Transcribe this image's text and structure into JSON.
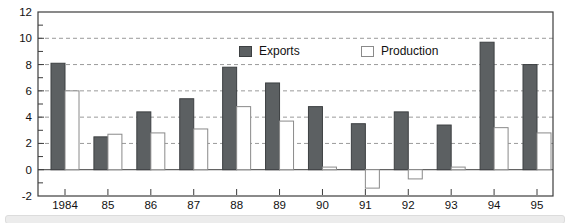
{
  "chart_data": {
    "type": "bar",
    "title": "",
    "xlabel": "",
    "ylabel": "",
    "categories": [
      "1984",
      "85",
      "86",
      "87",
      "88",
      "89",
      "90",
      "91",
      "92",
      "93",
      "94",
      "95"
    ],
    "series": [
      {
        "name": "Exports",
        "values": [
          8.1,
          2.5,
          4.4,
          5.4,
          7.8,
          6.6,
          4.8,
          3.5,
          4.4,
          3.4,
          9.7,
          8.0
        ],
        "fill": "#5c6062",
        "stroke": "#3d4042"
      },
      {
        "name": "Production",
        "values": [
          6.0,
          2.7,
          2.8,
          3.1,
          4.8,
          3.7,
          0.2,
          -1.4,
          -0.7,
          0.2,
          3.2,
          2.8
        ],
        "fill": "#ffffff",
        "stroke": "#8a8a8a"
      }
    ],
    "ylim": [
      -2,
      12
    ],
    "y_tick_labels": [
      "12",
      "10",
      "8",
      "6",
      "4",
      "2",
      "0",
      "-2"
    ],
    "y_labeled_values": [
      12,
      10,
      8,
      6,
      4,
      2,
      0,
      -2
    ],
    "gridline_values": [
      10,
      8,
      6,
      4,
      2
    ],
    "grid": "dashed-horizontal",
    "legend_position": "top-inside",
    "colors": {
      "frame": "#3c3c3c",
      "gridline": "#9a9a9a",
      "zero_line": "#3c3c3c",
      "tick": "#3c3c3c",
      "label_text": "#111111"
    }
  }
}
